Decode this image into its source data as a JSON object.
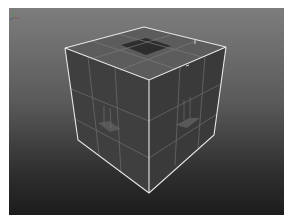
{
  "viewport": {
    "name": "perspective-viewport",
    "background_top": "#7d7d7d",
    "background_bottom": "#1c1c1c",
    "wire_color": "#e6e6e6",
    "edge_color": "#8a8a8a",
    "face_colors": {
      "top": "#5c5c5c",
      "left": "#3e3e3e",
      "right": "#3a3a3a",
      "hole": "#2c2c2c",
      "inset": "#555555"
    },
    "selected_object": "polyCube (subdivided, with inset holes)",
    "axis_gizmo": "xyz-axis-icon"
  }
}
